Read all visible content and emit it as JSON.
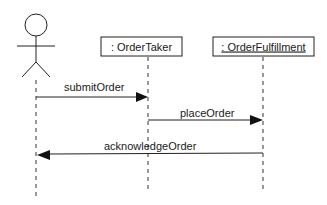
{
  "diagram": {
    "type": "uml-sequence",
    "actor": {
      "name": ""
    },
    "lifelines": [
      {
        "id": "orderTaker",
        "label": ": OrderTaker",
        "underlined": false
      },
      {
        "id": "orderFulfillment",
        "label": ": OrderFulfillment",
        "underlined": true
      }
    ],
    "messages": [
      {
        "label": "submitOrder",
        "from": "actor",
        "to": "orderTaker"
      },
      {
        "label": "placeOrder",
        "from": "orderTaker",
        "to": "orderFulfillment"
      },
      {
        "label": "acknowledgeOrder",
        "from": "orderFulfillment",
        "to": "actor"
      }
    ]
  }
}
